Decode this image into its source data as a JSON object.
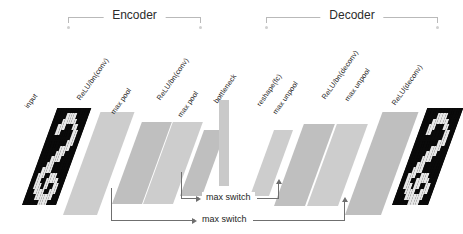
{
  "diagram": {
    "sections": [
      {
        "id": "encoder",
        "label": "Encoder",
        "x": 68,
        "width": 133
      },
      {
        "id": "decoder",
        "label": "Decoder",
        "x": 266,
        "width": 172
      }
    ],
    "layers": [
      {
        "id": "input",
        "label": "input",
        "type": "image-plane",
        "x": 22,
        "y": 108,
        "w": 34,
        "h": 97,
        "tone": "image",
        "label_x": 30,
        "label_y": 102
      },
      {
        "id": "relu-bn-conv-1",
        "label": "ReLU/bn(conv)",
        "type": "plane",
        "x": 63,
        "y": 112,
        "w": 34,
        "h": 103,
        "tone": "light",
        "label_x": 82,
        "label_y": 94
      },
      {
        "id": "max-pool-1",
        "label": "max pool",
        "type": "plane",
        "x": 112,
        "y": 122,
        "w": 30,
        "h": 82,
        "tone": "mid",
        "label_x": 116,
        "label_y": 108
      },
      {
        "id": "relu-bn-conv-2",
        "label": "ReLU/bn(conv)",
        "type": "plane",
        "x": 143,
        "y": 122,
        "w": 30,
        "h": 82,
        "tone": "light",
        "label_x": 162,
        "label_y": 94
      },
      {
        "id": "max-pool-2",
        "label": "max pool",
        "type": "plane",
        "x": 180,
        "y": 130,
        "w": 22,
        "h": 66,
        "tone": "mid",
        "label_x": 183,
        "label_y": 111
      },
      {
        "id": "bottleneck",
        "label": "bottleneck",
        "type": "flat",
        "x": 219,
        "y": 100,
        "w": 10,
        "h": 86,
        "tone": "flat",
        "label_x": 219,
        "label_y": 97
      },
      {
        "id": "reshape-fc",
        "label": "reshape(fc)",
        "type": "plane",
        "x": 250,
        "y": 130,
        "w": 19,
        "h": 66,
        "tone": "light",
        "label_x": 262,
        "label_y": 100
      },
      {
        "id": "max-unpool-1",
        "label": "max unpool",
        "type": "plane",
        "x": 274,
        "y": 124,
        "w": 31,
        "h": 82,
        "tone": "mid",
        "label_x": 278,
        "label_y": 108
      },
      {
        "id": "relu-bn-deconv",
        "label": "ReLU/bn(deconv)",
        "type": "plane",
        "x": 307,
        "y": 124,
        "w": 31,
        "h": 82,
        "tone": "light",
        "label_x": 327,
        "label_y": 93
      },
      {
        "id": "max-unpool-2",
        "label": "max unpool",
        "type": "plane",
        "x": 345,
        "y": 112,
        "w": 36,
        "h": 103,
        "tone": "mid",
        "label_x": 350,
        "label_y": 95
      },
      {
        "id": "relu-deconv",
        "label": "ReLU(deconv)",
        "type": "image-plane",
        "x": 392,
        "y": 108,
        "w": 36,
        "h": 97,
        "tone": "image",
        "label_x": 397,
        "label_y": 99
      }
    ],
    "connections": [
      {
        "id": "max-switch-upper",
        "label": "max switch"
      },
      {
        "id": "max-switch-lower",
        "label": "max switch"
      }
    ],
    "colors": {
      "plane_light": "#cdcdcd",
      "plane_mid": "#bfbfbf",
      "plane_dark": "#b4b4b4",
      "image_background": "#0a0a0a",
      "digit_stroke": "#e8e8e8",
      "connector": "#6f6f6f",
      "bracket": "#b9b9b9",
      "text": "#1f1f1f"
    }
  }
}
